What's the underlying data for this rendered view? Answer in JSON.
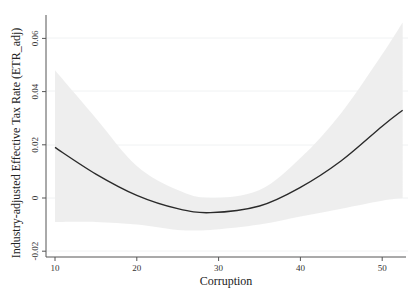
{
  "chart_data": {
    "type": "line",
    "title": "",
    "xlabel": "Corruption",
    "ylabel": "Industry-adjusted Effective Tax Rate (ETR_adj)",
    "xlim": [
      9,
      53
    ],
    "ylim": [
      -0.022,
      0.068
    ],
    "x_ticks": [
      10,
      20,
      30,
      40,
      50
    ],
    "y_ticks": [
      -0.02,
      0,
      0.02,
      0.04,
      0.06
    ],
    "x_tick_labels": [
      "10",
      "20",
      "30",
      "40",
      "50"
    ],
    "y_tick_labels": [
      "-0.02",
      "0",
      "0.02",
      "0.04",
      "0.06"
    ],
    "grid": "horizontal, faint",
    "legend": null,
    "series": [
      {
        "name": "Fitted quadratic",
        "x": [
          10,
          15,
          20,
          25,
          29,
          35,
          40,
          45,
          50,
          52.5
        ],
        "y": [
          0.019,
          0.009,
          0.001,
          -0.004,
          -0.0055,
          -0.003,
          0.004,
          0.014,
          0.027,
          0.033
        ]
      },
      {
        "name": "95% CI upper",
        "x": [
          10,
          15,
          20,
          25,
          29,
          35,
          40,
          45,
          50,
          52.5
        ],
        "y": [
          0.048,
          0.03,
          0.012,
          0.003,
          0.0,
          0.003,
          0.015,
          0.032,
          0.054,
          0.066
        ]
      },
      {
        "name": "95% CI lower",
        "x": [
          10,
          15,
          20,
          25,
          29,
          35,
          40,
          45,
          50,
          52.5
        ],
        "y": [
          -0.009,
          -0.009,
          -0.01,
          -0.012,
          -0.012,
          -0.01,
          -0.007,
          -0.004,
          -0.001,
          0.0
        ]
      }
    ]
  },
  "axes": {
    "x_title": "Corruption",
    "y_title": "Industry-adjusted Effective Tax Rate (ETR_adj)",
    "x_labels": [
      "10",
      "20",
      "30",
      "40",
      "50"
    ],
    "y_labels": [
      "-0.02",
      "0",
      "0.02",
      "0.04",
      "0.06"
    ]
  },
  "colors": {
    "band": "#ececec",
    "line": "#2a2a2a",
    "axis": "#555555"
  }
}
